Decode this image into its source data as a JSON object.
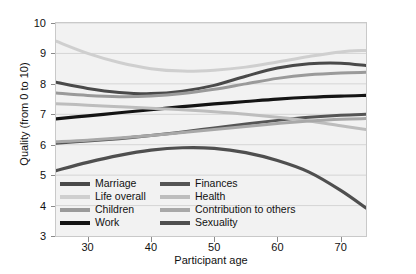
{
  "chart_data": {
    "type": "line",
    "title": "",
    "xlabel": "Participant age",
    "ylabel": "Quality (from 0 to 10)",
    "xlim": [
      25,
      74
    ],
    "ylim": [
      3,
      10
    ],
    "xticks": [
      30,
      40,
      50,
      60,
      70
    ],
    "yticks": [
      3,
      4,
      5,
      6,
      7,
      8,
      9,
      10
    ],
    "grid": true,
    "legend_position": "inside-bottom-left",
    "x": [
      25,
      30,
      35,
      40,
      45,
      50,
      55,
      60,
      65,
      70,
      74
    ],
    "series": [
      {
        "name": "Marriage",
        "color": "#4a4a4a",
        "width": 3.0,
        "values": [
          8.05,
          7.85,
          7.72,
          7.68,
          7.76,
          7.95,
          8.25,
          8.52,
          8.66,
          8.68,
          8.6
        ]
      },
      {
        "name": "Life overall",
        "color": "#cfcfcf",
        "width": 3.0,
        "values": [
          9.4,
          9.0,
          8.7,
          8.5,
          8.42,
          8.45,
          8.55,
          8.72,
          8.9,
          9.05,
          9.1
        ]
      },
      {
        "name": "Children",
        "color": "#9a9a9a",
        "width": 3.0,
        "values": [
          7.7,
          7.62,
          7.58,
          7.6,
          7.68,
          7.82,
          8.0,
          8.18,
          8.3,
          8.36,
          8.38
        ]
      },
      {
        "name": "Work",
        "color": "#141414",
        "width": 3.2,
        "values": [
          6.85,
          6.95,
          7.05,
          7.15,
          7.25,
          7.34,
          7.42,
          7.5,
          7.56,
          7.6,
          7.62
        ]
      },
      {
        "name": "Finances",
        "color": "#555555",
        "width": 3.0,
        "values": [
          6.05,
          6.12,
          6.2,
          6.3,
          6.42,
          6.55,
          6.68,
          6.8,
          6.9,
          6.97,
          7.0
        ]
      },
      {
        "name": "Health",
        "color": "#bdbdbd",
        "width": 3.0,
        "values": [
          7.35,
          7.3,
          7.25,
          7.2,
          7.15,
          7.08,
          7.0,
          6.9,
          6.78,
          6.62,
          6.5
        ]
      },
      {
        "name": "Contribution to others",
        "color": "#a8a8a8",
        "width": 3.0,
        "values": [
          6.1,
          6.15,
          6.22,
          6.3,
          6.4,
          6.5,
          6.6,
          6.7,
          6.78,
          6.84,
          6.86
        ]
      },
      {
        "name": "Sexuality",
        "color": "#4f4f4f",
        "width": 3.2,
        "values": [
          5.15,
          5.42,
          5.65,
          5.82,
          5.9,
          5.88,
          5.74,
          5.48,
          5.1,
          4.5,
          3.92
        ]
      }
    ],
    "legend": [
      {
        "label": "Marriage",
        "color": "#4a4a4a"
      },
      {
        "label": "Finances",
        "color": "#555555"
      },
      {
        "label": "Life overall",
        "color": "#cfcfcf"
      },
      {
        "label": "Health",
        "color": "#bdbdbd"
      },
      {
        "label": "Children",
        "color": "#9a9a9a"
      },
      {
        "label": "Contribution to others",
        "color": "#a8a8a8"
      },
      {
        "label": "Work",
        "color": "#141414"
      },
      {
        "label": "Sexuality",
        "color": "#4f4f4f"
      }
    ]
  }
}
